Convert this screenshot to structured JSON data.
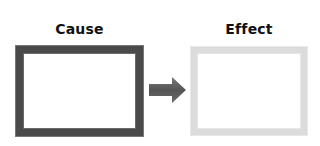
{
  "diagram": {
    "cause": {
      "label": "Cause",
      "border_color": "#4a4a4a"
    },
    "effect": {
      "label": "Effect",
      "border_color": "#dcdcdc"
    },
    "arrow": {
      "icon": "right-arrow-icon",
      "color": "#5a5a5a"
    }
  }
}
